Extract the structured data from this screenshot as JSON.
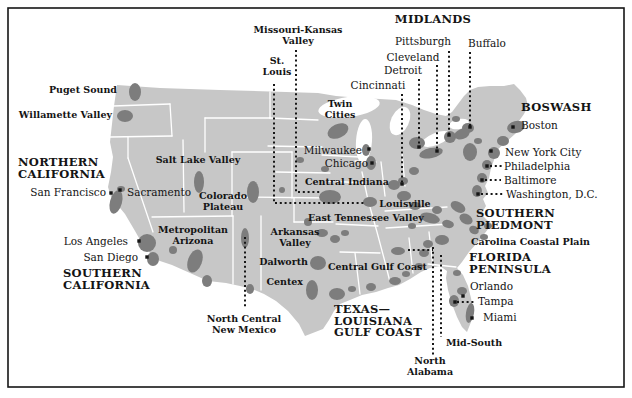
{
  "figure": {
    "kind": "map"
  },
  "map": {
    "colors": {
      "land": "#c7c7c7",
      "urban": "#7d7d7d",
      "water": "#ffffff",
      "line": "#161616",
      "state_border": "#ffffff",
      "text": "#141414"
    },
    "labels": [
      {
        "id": "puget-sound",
        "lines": [
          "Puget Sound"
        ],
        "kind": "region",
        "x": 117,
        "y": 85,
        "align": "right"
      },
      {
        "id": "willamette-valley",
        "lines": [
          "Willamette Valley"
        ],
        "kind": "region",
        "x": 112,
        "y": 110,
        "align": "right"
      },
      {
        "id": "northern-california",
        "lines": [
          "NORTHERN",
          "CALIFORNIA"
        ],
        "kind": "mega",
        "x": 18,
        "y": 157,
        "align": "left"
      },
      {
        "id": "san-francisco",
        "lines": [
          "San Francisco"
        ],
        "kind": "city",
        "x": 106,
        "y": 186,
        "align": "right"
      },
      {
        "id": "sacramento",
        "lines": [
          "Sacramento"
        ],
        "kind": "city",
        "x": 127,
        "y": 186,
        "align": "left"
      },
      {
        "id": "salt-lake-valley",
        "lines": [
          "Salt Lake Valley"
        ],
        "kind": "region",
        "x": 198,
        "y": 155,
        "align": "center"
      },
      {
        "id": "colorado-plateau",
        "lines": [
          "Colorado",
          "Plateau"
        ],
        "kind": "region",
        "x": 223,
        "y": 191,
        "align": "center"
      },
      {
        "id": "metropolitan-arizona",
        "lines": [
          "Metropolitan",
          "Arizona"
        ],
        "kind": "region",
        "x": 193,
        "y": 225,
        "align": "center"
      },
      {
        "id": "los-angeles",
        "lines": [
          "Los Angeles"
        ],
        "kind": "city",
        "x": 128,
        "y": 235,
        "align": "right"
      },
      {
        "id": "san-diego",
        "lines": [
          "San Diego"
        ],
        "kind": "city",
        "x": 138,
        "y": 251,
        "align": "right"
      },
      {
        "id": "southern-california",
        "lines": [
          "SOUTHERN",
          "CALIFORNIA"
        ],
        "kind": "mega",
        "x": 63,
        "y": 268,
        "align": "left"
      },
      {
        "id": "north-central-new-mexico",
        "lines": [
          "North Central",
          "New Mexico"
        ],
        "kind": "region",
        "x": 244,
        "y": 314,
        "align": "center"
      },
      {
        "id": "missouri-kansas-valley",
        "lines": [
          "Missouri-Kansas",
          "Valley"
        ],
        "kind": "region",
        "x": 298,
        "y": 25,
        "align": "center"
      },
      {
        "id": "st-louis",
        "lines": [
          "St.",
          "Louis"
        ],
        "kind": "region",
        "x": 277,
        "y": 56,
        "align": "center"
      },
      {
        "id": "midlands",
        "lines": [
          "MIDLANDS"
        ],
        "kind": "mega",
        "x": 433,
        "y": 14,
        "align": "center"
      },
      {
        "id": "pittsburgh",
        "lines": [
          "Pittsburgh"
        ],
        "kind": "city",
        "x": 423,
        "y": 35,
        "align": "center"
      },
      {
        "id": "buffalo",
        "lines": [
          "Buffalo"
        ],
        "kind": "city",
        "x": 487,
        "y": 37,
        "align": "center"
      },
      {
        "id": "cleveland",
        "lines": [
          "Cleveland"
        ],
        "kind": "city",
        "x": 413,
        "y": 51,
        "align": "center"
      },
      {
        "id": "detroit",
        "lines": [
          "Detroit"
        ],
        "kind": "city",
        "x": 403,
        "y": 64,
        "align": "center"
      },
      {
        "id": "cincinnati",
        "lines": [
          "Cincinnati"
        ],
        "kind": "city",
        "x": 378,
        "y": 79,
        "align": "center"
      },
      {
        "id": "twin-cities",
        "lines": [
          "Twin",
          "Cities"
        ],
        "kind": "region",
        "x": 340,
        "y": 99,
        "align": "center"
      },
      {
        "id": "boswash",
        "lines": [
          "BOSWASH"
        ],
        "kind": "mega",
        "x": 521,
        "y": 102,
        "align": "left"
      },
      {
        "id": "boston",
        "lines": [
          "Boston"
        ],
        "kind": "city",
        "x": 521,
        "y": 119,
        "align": "left"
      },
      {
        "id": "milwaukee",
        "lines": [
          "Milwaukee"
        ],
        "kind": "city",
        "x": 362,
        "y": 144,
        "align": "right"
      },
      {
        "id": "chicago",
        "lines": [
          "Chicago"
        ],
        "kind": "city",
        "x": 368,
        "y": 157,
        "align": "right"
      },
      {
        "id": "central-indiana",
        "lines": [
          "Central Indiana"
        ],
        "kind": "region",
        "x": 305,
        "y": 177,
        "align": "left"
      },
      {
        "id": "new-york-city",
        "lines": [
          "New York City"
        ],
        "kind": "city",
        "x": 505,
        "y": 146,
        "align": "left"
      },
      {
        "id": "philadelphia",
        "lines": [
          "Philadelphia"
        ],
        "kind": "city",
        "x": 504,
        "y": 160,
        "align": "left"
      },
      {
        "id": "baltimore",
        "lines": [
          "Baltimore"
        ],
        "kind": "city",
        "x": 504,
        "y": 174,
        "align": "left"
      },
      {
        "id": "washington-dc",
        "lines": [
          "Washington, D.C."
        ],
        "kind": "city",
        "x": 506,
        "y": 188,
        "align": "left"
      },
      {
        "id": "louisville",
        "lines": [
          "Louisville"
        ],
        "kind": "region",
        "x": 405,
        "y": 199,
        "align": "center"
      },
      {
        "id": "east-tennessee-valley",
        "lines": [
          "East Tennessee Valley"
        ],
        "kind": "region",
        "x": 308,
        "y": 213,
        "align": "left"
      },
      {
        "id": "southern-piedmont",
        "lines": [
          "SOUTHERN",
          "PIEDMONT"
        ],
        "kind": "mega",
        "x": 476,
        "y": 208,
        "align": "left"
      },
      {
        "id": "carolina-coastal-plain",
        "lines": [
          "Carolina Coastal Plain"
        ],
        "kind": "region",
        "x": 471,
        "y": 237,
        "align": "left"
      },
      {
        "id": "arkansas-valley",
        "lines": [
          "Arkansas",
          "Valley"
        ],
        "kind": "region",
        "x": 295,
        "y": 227,
        "align": "center"
      },
      {
        "id": "dalworth",
        "lines": [
          "Dalworth"
        ],
        "kind": "region",
        "x": 308,
        "y": 257,
        "align": "right"
      },
      {
        "id": "centex",
        "lines": [
          "Centex"
        ],
        "kind": "region",
        "x": 303,
        "y": 277,
        "align": "right"
      },
      {
        "id": "central-gulf-coast",
        "lines": [
          "Central Gulf Coast"
        ],
        "kind": "region",
        "x": 328,
        "y": 262,
        "align": "left"
      },
      {
        "id": "florida-peninsula",
        "lines": [
          "FLORIDA",
          "PENINSULA"
        ],
        "kind": "mega",
        "x": 469,
        "y": 252,
        "align": "left"
      },
      {
        "id": "orlando",
        "lines": [
          "Orlando"
        ],
        "kind": "city",
        "x": 470,
        "y": 280,
        "align": "left"
      },
      {
        "id": "tampa",
        "lines": [
          "Tampa"
        ],
        "kind": "city",
        "x": 478,
        "y": 295,
        "align": "left"
      },
      {
        "id": "miami",
        "lines": [
          "Miami"
        ],
        "kind": "city",
        "x": 483,
        "y": 311,
        "align": "left"
      },
      {
        "id": "texas-louisiana-gulf-coast",
        "lines": [
          "TEXAS—",
          "LOUISIANA",
          "GULF COAST"
        ],
        "kind": "mega",
        "x": 334,
        "y": 304,
        "align": "left"
      },
      {
        "id": "mid-south",
        "lines": [
          "Mid-South"
        ],
        "kind": "region",
        "x": 446,
        "y": 338,
        "align": "left"
      },
      {
        "id": "north-alabama",
        "lines": [
          "North",
          "Alabama"
        ],
        "kind": "region",
        "x": 430,
        "y": 356,
        "align": "center"
      }
    ],
    "leaders": [
      [
        [
          274,
          84
        ],
        [
          274,
          203
        ],
        [
          365,
          203
        ]
      ],
      [
        [
          296,
          50
        ],
        [
          296,
          192
        ],
        [
          320,
          192
        ]
      ],
      [
        [
          402,
          94
        ],
        [
          402,
          183
        ]
      ],
      [
        [
          419,
          79
        ],
        [
          419,
          146
        ]
      ],
      [
        [
          437,
          65
        ],
        [
          437,
          150
        ]
      ],
      [
        [
          449,
          51
        ],
        [
          449,
          134
        ]
      ],
      [
        [
          470,
          52
        ],
        [
          470,
          126
        ]
      ],
      [
        [
          490,
          166
        ],
        [
          502,
          166
        ]
      ],
      [
        [
          485,
          180
        ],
        [
          501,
          180
        ]
      ],
      [
        [
          481,
          194
        ],
        [
          503,
          194
        ]
      ],
      [
        [
          457,
          302
        ],
        [
          475,
          302
        ]
      ],
      [
        [
          408,
          250
        ],
        [
          433,
          250
        ]
      ],
      [
        [
          433,
          247
        ],
        [
          433,
          355
        ]
      ],
      [
        [
          441,
          255
        ],
        [
          441,
          337
        ]
      ],
      [
        [
          245,
          237
        ],
        [
          245,
          308
        ]
      ]
    ],
    "city_dots": [
      [
        111,
        193
      ],
      [
        120,
        190
      ],
      [
        139,
        241
      ],
      [
        147,
        257
      ],
      [
        369,
        149
      ],
      [
        372,
        163
      ],
      [
        513,
        127
      ],
      [
        491,
        151
      ],
      [
        487,
        166
      ],
      [
        482,
        180
      ],
      [
        478,
        194
      ],
      [
        402,
        184
      ],
      [
        419,
        147
      ],
      [
        437,
        151
      ],
      [
        449,
        135
      ],
      [
        470,
        127
      ],
      [
        463,
        296
      ],
      [
        455,
        302
      ],
      [
        472,
        318
      ]
    ],
    "urban_areas": [
      [
        135,
        92,
        6,
        9,
        0
      ],
      [
        125,
        116,
        8,
        6,
        0
      ],
      [
        116,
        202,
        6,
        12,
        15
      ],
      [
        121,
        189,
        4,
        3,
        0
      ],
      [
        147,
        243,
        9,
        9,
        0
      ],
      [
        153,
        259,
        6,
        7,
        0
      ],
      [
        199,
        182,
        5,
        11,
        0
      ],
      [
        253,
        192,
        6,
        11,
        0
      ],
      [
        195,
        261,
        7,
        12,
        20
      ],
      [
        207,
        281,
        5,
        6,
        0
      ],
      [
        173,
        250,
        4,
        4,
        0
      ],
      [
        245,
        238,
        4,
        10,
        0
      ],
      [
        250,
        289,
        4,
        5,
        0
      ],
      [
        338,
        131,
        11,
        7,
        -25
      ],
      [
        366,
        150,
        4,
        6,
        0
      ],
      [
        371,
        163,
        5,
        7,
        0
      ],
      [
        330,
        197,
        11,
        7,
        0
      ],
      [
        370,
        202,
        7,
        5,
        0
      ],
      [
        308,
        222,
        4,
        4,
        0
      ],
      [
        322,
        233,
        6,
        4,
        0
      ],
      [
        335,
        239,
        5,
        4,
        0
      ],
      [
        345,
        233,
        4,
        3,
        0
      ],
      [
        318,
        263,
        8,
        7,
        0
      ],
      [
        312,
        290,
        6,
        10,
        0
      ],
      [
        337,
        294,
        8,
        6,
        0
      ],
      [
        352,
        289,
        4,
        3,
        0
      ],
      [
        371,
        287,
        5,
        4,
        0
      ],
      [
        395,
        281,
        6,
        4,
        0
      ],
      [
        406,
        274,
        4,
        3,
        0
      ],
      [
        419,
        266,
        4,
        3,
        0
      ],
      [
        398,
        251,
        7,
        4,
        0
      ],
      [
        428,
        244,
        5,
        4,
        0
      ],
      [
        424,
        253,
        5,
        4,
        0
      ],
      [
        442,
        240,
        7,
        5,
        0
      ],
      [
        412,
        226,
        4,
        3,
        0
      ],
      [
        394,
        185,
        6,
        5,
        0
      ],
      [
        404,
        196,
        7,
        5,
        0
      ],
      [
        415,
        206,
        6,
        4,
        0
      ],
      [
        430,
        218,
        10,
        5,
        15
      ],
      [
        448,
        224,
        6,
        4,
        15
      ],
      [
        417,
        143,
        8,
        6,
        0
      ],
      [
        431,
        153,
        12,
        5,
        -12
      ],
      [
        450,
        137,
        6,
        6,
        0
      ],
      [
        468,
        128,
        6,
        5,
        0
      ],
      [
        456,
        119,
        4,
        3,
        0
      ],
      [
        403,
        181,
        5,
        4,
        0
      ],
      [
        414,
        171,
        5,
        4,
        0
      ],
      [
        462,
        134,
        8,
        5,
        -20
      ],
      [
        470,
        152,
        7,
        9,
        0
      ],
      [
        478,
        141,
        4,
        3,
        0
      ],
      [
        516,
        127,
        9,
        6,
        -15
      ],
      [
        503,
        141,
        6,
        5,
        0
      ],
      [
        494,
        153,
        6,
        6,
        0
      ],
      [
        487,
        165,
        5,
        5,
        0
      ],
      [
        482,
        178,
        5,
        5,
        0
      ],
      [
        477,
        191,
        5,
        6,
        0
      ],
      [
        458,
        207,
        8,
        5,
        30
      ],
      [
        466,
        219,
        7,
        5,
        30
      ],
      [
        474,
        230,
        5,
        4,
        30
      ],
      [
        437,
        210,
        5,
        4,
        0
      ],
      [
        488,
        226,
        4,
        3,
        0
      ],
      [
        484,
        237,
        4,
        3,
        0
      ],
      [
        457,
        273,
        4,
        3,
        0
      ],
      [
        462,
        291,
        5,
        4,
        0
      ],
      [
        454,
        301,
        5,
        6,
        0
      ],
      [
        470,
        313,
        4,
        10,
        10
      ],
      [
        300,
        160,
        4,
        3,
        0
      ],
      [
        325,
        169,
        4,
        3,
        0
      ],
      [
        282,
        190,
        3,
        3,
        0
      ]
    ]
  }
}
